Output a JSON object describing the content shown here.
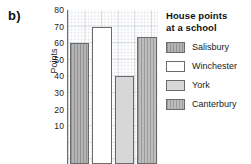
{
  "part_label": "b)",
  "legend": {
    "title_line1": "House points",
    "title_line2": "at a school",
    "items": [
      {
        "label": "Salisbury",
        "fill": "f-darkhatch"
      },
      {
        "label": "Winchester",
        "fill": "f-white"
      },
      {
        "label": "York",
        "fill": "f-light"
      },
      {
        "label": "Canterbury",
        "fill": "f-midhatch"
      }
    ]
  },
  "chart_data": {
    "type": "bar",
    "title": "House points at a school",
    "xlabel": "",
    "ylabel": "Points",
    "categories": [
      "Salisbury",
      "Winchester",
      "York",
      "Canterbury"
    ],
    "values": [
      60,
      70,
      40,
      64
    ],
    "ylim": [
      0,
      80
    ],
    "yticks": [
      80,
      70,
      60,
      50,
      40,
      30,
      20,
      10
    ],
    "ytick_labels": [
      "80",
      "70",
      "60",
      "50",
      "40",
      "30",
      "20",
      "10"
    ],
    "grid": true,
    "grid_style": "graph-paper minor and major gridlines",
    "legend_position": "right",
    "note_cropped": "plot is cropped below the 10 gridline; no x-axis tick labels visible",
    "bar_fills": [
      "f-darkhatch",
      "f-white",
      "f-light",
      "f-midhatch"
    ],
    "colors": {
      "salisbury": "#b4b4b4",
      "winchester": "#ffffff",
      "york": "#d7d7d7",
      "canterbury": "#bdbdbd",
      "bar_outline": "#6a6a6a",
      "axis": "#6d6d6d",
      "grid": "#96a0af",
      "text": "#1b1b1b"
    }
  }
}
